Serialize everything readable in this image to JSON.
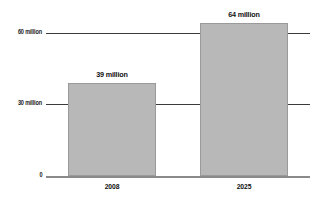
{
  "chart_data": {
    "type": "bar",
    "title": "",
    "subtitle": "",
    "xlabel": "",
    "ylabel": "",
    "categories": [
      "2008",
      "2025"
    ],
    "values": [
      39,
      64
    ],
    "value_labels": [
      "39 million",
      "64 million"
    ],
    "unit": "million",
    "ylim": [
      0,
      70
    ],
    "yticks": [
      0,
      30,
      60
    ],
    "ytick_labels": [
      "0",
      "30 million",
      "60 million"
    ],
    "grid": true,
    "grid_axis": "y",
    "legend": false,
    "legend_position": "none",
    "series": [
      {
        "name": "",
        "values": [
          39,
          64
        ],
        "color": "#b8b8b8"
      }
    ]
  },
  "colors": {
    "bar_fill": "#b8b8b8",
    "bar_border": "#9a9a9a",
    "gridline": "#3a3a3a",
    "baseline": "#8a8a8a",
    "text": "#101010",
    "background": "#ffffff"
  }
}
